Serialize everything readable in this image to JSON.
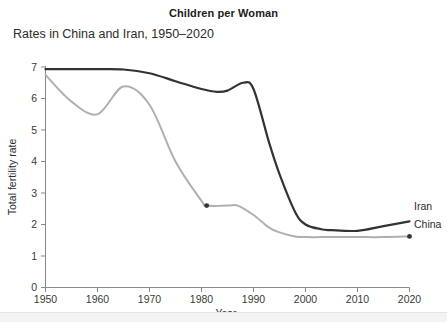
{
  "chart_data": {
    "type": "line",
    "title": "Children per Woman",
    "subtitle": "Rates in China and Iran, 1950–2020",
    "xlabel": "Year",
    "ylabel": "Total fertility rate",
    "xlim": [
      1950,
      2020
    ],
    "ylim": [
      0,
      7
    ],
    "xticks": [
      1950,
      1960,
      1970,
      1980,
      1990,
      2000,
      2010,
      2020
    ],
    "yticks": [
      0,
      1,
      2,
      3,
      4,
      5,
      6,
      7
    ],
    "grid": false,
    "legend_position": "right-end-labels",
    "series": [
      {
        "name": "Iran",
        "color": "#333333",
        "label": "Iran",
        "label_value": 2.1,
        "x": [
          1950,
          1955,
          1960,
          1965,
          1970,
          1975,
          1980,
          1983,
          1985,
          1988,
          1990,
          1993,
          1995,
          1998,
          2000,
          2003,
          2005,
          2010,
          2015,
          2020
        ],
        "values": [
          6.93,
          6.93,
          6.93,
          6.92,
          6.8,
          6.55,
          6.3,
          6.21,
          6.25,
          6.5,
          6.3,
          4.6,
          3.6,
          2.4,
          2.0,
          1.85,
          1.82,
          1.8,
          1.95,
          2.1
        ]
      },
      {
        "name": "China",
        "color": "#b0b0b0",
        "label": "China",
        "label_value": 1.62,
        "x": [
          1950,
          1955,
          1960,
          1965,
          1970,
          1975,
          1980,
          1981,
          1985,
          1987,
          1990,
          1993,
          1995,
          1998,
          2000,
          2005,
          2010,
          2015,
          2020
        ],
        "values": [
          6.75,
          5.9,
          5.5,
          6.38,
          5.8,
          4.0,
          2.75,
          2.6,
          2.6,
          2.6,
          2.3,
          1.9,
          1.75,
          1.62,
          1.6,
          1.6,
          1.6,
          1.6,
          1.62
        ],
        "markers": [
          {
            "x": 1981,
            "y": 2.6
          },
          {
            "x": 2020,
            "y": 1.62
          }
        ]
      }
    ]
  },
  "chart": {
    "title": "Children per Woman",
    "subtitle": "Rates in China and Iran, 1950–2020",
    "xlabel": "Year",
    "ylabel": "Total fertility rate",
    "xticks": [
      "1950",
      "1960",
      "1970",
      "1980",
      "1990",
      "2000",
      "2010",
      "2020"
    ],
    "yticks": [
      "0",
      "1",
      "2",
      "3",
      "4",
      "5",
      "6",
      "7"
    ],
    "series_labels": [
      "Iran",
      "China"
    ]
  }
}
